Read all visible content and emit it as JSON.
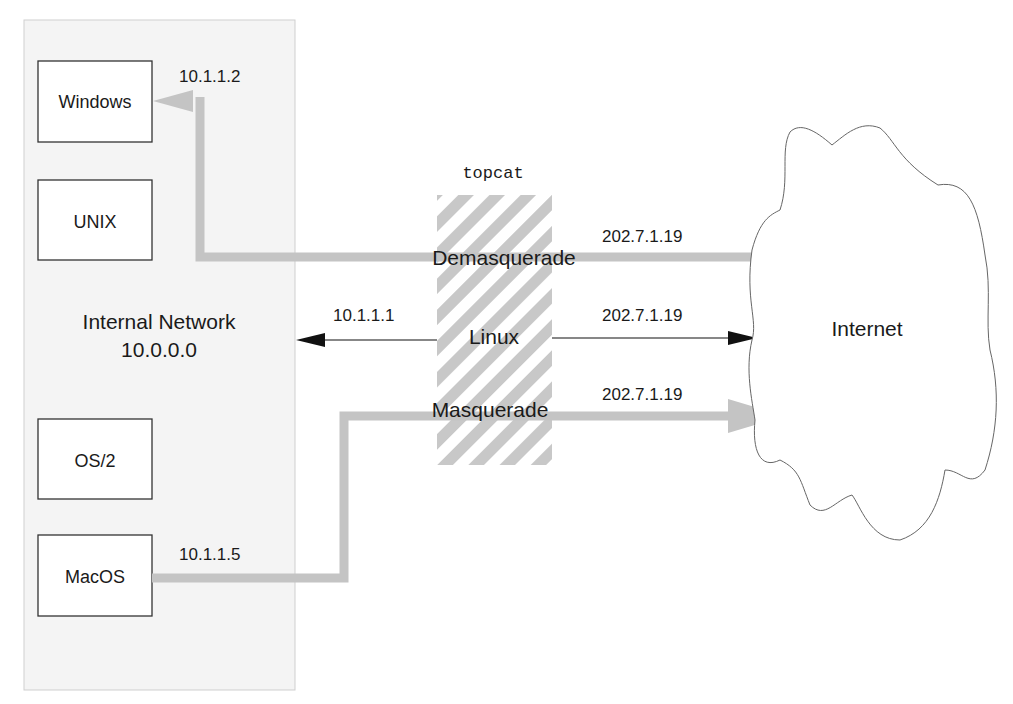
{
  "diagram": {
    "internal_network": {
      "title": "Internal Network",
      "address": "10.0.0.0",
      "hosts": [
        {
          "name": "Windows",
          "ip": "10.1.1.2"
        },
        {
          "name": "UNIX",
          "ip": ""
        },
        {
          "name": "OS/2",
          "ip": ""
        },
        {
          "name": "MacOS",
          "ip": "10.1.1.5"
        }
      ]
    },
    "gateway": {
      "hostname": "topcat",
      "os": "Linux",
      "internal_ip": "10.1.1.1",
      "external_ip": "202.7.1.19"
    },
    "flows": {
      "demasquerade": {
        "label": "Demasquerade",
        "ip": "202.7.1.19"
      },
      "direct": {
        "ip": "202.7.1.19"
      },
      "masquerade": {
        "label": "Masquerade",
        "ip": "202.7.1.19"
      }
    },
    "internet": {
      "label": "Internet"
    },
    "colors": {
      "panel": "#f4f4f4",
      "flow": "#c4c4c4",
      "hatch": "#c8c8c8",
      "stroke": "#333333"
    }
  }
}
